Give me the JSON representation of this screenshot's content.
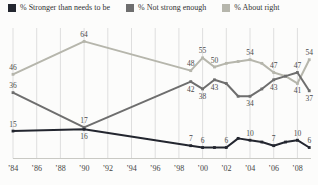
{
  "colors": {
    "background": "#fcfcfb",
    "gridline": "#dedede",
    "axis": "#c9c9c4",
    "data_label": "#4a4a4a",
    "tick_label": "#444444",
    "series_stronger": "#23262f",
    "series_not_strong": "#6e6e6e",
    "series_about_right": "#b6b6ac"
  },
  "chart_data": {
    "type": "line",
    "title": "",
    "legend_position": "top",
    "grid": "vertical-only",
    "ylim": [
      0,
      70
    ],
    "x_axis": {
      "tick_labels": [
        "’84",
        "’86",
        "’88",
        "’90",
        "’92",
        "’94",
        "’96",
        "’98",
        "’00",
        "’02",
        "’04",
        "’06",
        "’08"
      ],
      "tick_years": [
        1984,
        1986,
        1988,
        1990,
        1992,
        1994,
        1996,
        1998,
        2000,
        2002,
        2004,
        2006,
        2008
      ]
    },
    "x_values": [
      1984,
      1990,
      1999,
      2000,
      2001,
      2002,
      2003,
      2004,
      2005,
      2006,
      2007,
      2008,
      2009
    ],
    "series": [
      {
        "name": "% Stronger than needs to be",
        "color": "#23262f",
        "values": [
          15,
          16,
          7,
          6,
          6,
          6,
          11,
          10,
          9,
          7,
          9,
          10,
          6
        ],
        "point_labels": [
          "15",
          "16",
          "7",
          "6",
          null,
          "6",
          null,
          "10",
          null,
          "7",
          null,
          "10",
          "6"
        ],
        "label_side": [
          "above",
          "below",
          "above",
          "above",
          null,
          "above",
          null,
          "above",
          null,
          "above",
          null,
          "above",
          "above"
        ]
      },
      {
        "name": "% Not strong enough",
        "color": "#6e6e6e",
        "values": [
          36,
          17,
          42,
          38,
          43,
          41,
          34,
          34,
          38,
          43,
          45,
          47,
          37
        ],
        "point_labels": [
          "36",
          "17",
          "42",
          "38",
          "43",
          null,
          null,
          "34",
          null,
          "43",
          null,
          "47",
          "37"
        ],
        "label_side": [
          "above",
          "above",
          "below",
          "below",
          "below",
          null,
          null,
          "below",
          null,
          "below",
          null,
          "above",
          "below"
        ]
      },
      {
        "name": "% About right",
        "color": "#b6b6ac",
        "values": [
          46,
          64,
          48,
          55,
          50,
          52,
          53,
          54,
          52,
          47,
          45,
          41,
          54
        ],
        "point_labels": [
          "46",
          "64",
          "48",
          "55",
          "50",
          null,
          null,
          "54",
          null,
          "47",
          null,
          "41",
          "54"
        ],
        "label_side": [
          "above",
          "above",
          "above",
          "above",
          "above",
          null,
          null,
          "above",
          null,
          "above",
          null,
          "below",
          "above"
        ]
      }
    ]
  }
}
